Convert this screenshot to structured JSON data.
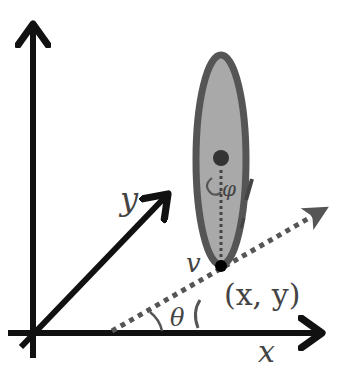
{
  "diagram": {
    "labels": {
      "x_axis": "x",
      "y_axis": "y",
      "position": "(x, y)",
      "heading_angle": "θ",
      "velocity": "v",
      "tilt_angle": "φ"
    },
    "colors": {
      "axis": "#111111",
      "ellipse_stroke": "#555555",
      "ellipse_fill": "#a9a9a9",
      "dotted_line": "#555555",
      "center_dot": "#333333",
      "position_dot": "#000000",
      "label": "#444444"
    }
  }
}
